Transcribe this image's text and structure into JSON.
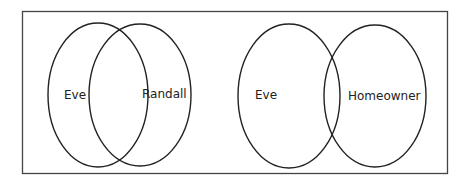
{
  "diagrams": [
    {
      "sets": [
        {
          "label": "Eve"
        },
        {
          "label": "Randall"
        }
      ],
      "relationship": "overlapping"
    },
    {
      "sets": [
        {
          "label": "Eve"
        },
        {
          "label": "Homeowner"
        }
      ],
      "relationship": "slightly overlapping"
    }
  ],
  "colors": {
    "stroke": "#222222",
    "background": "#ffffff"
  }
}
